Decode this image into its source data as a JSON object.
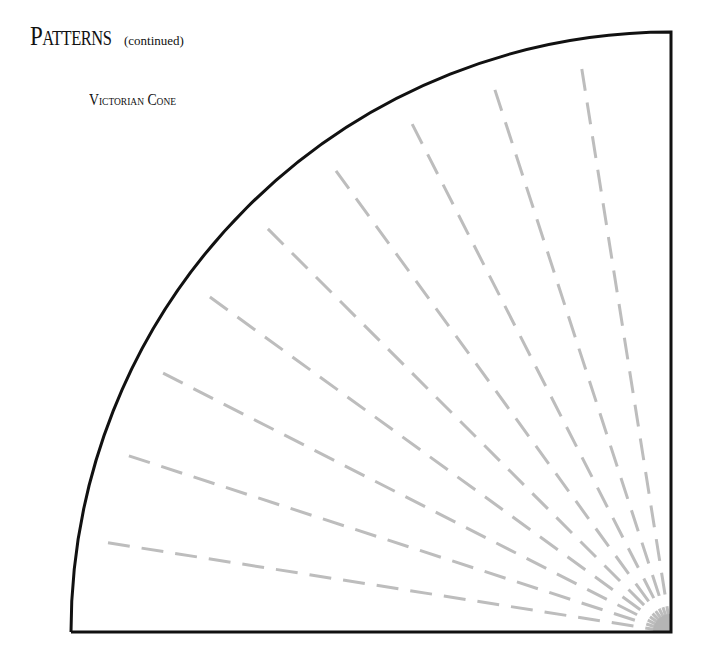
{
  "page": {
    "title": "Patterns",
    "title_suffix": "(continued)",
    "pattern_name": "Victorian Cone"
  },
  "pattern": {
    "shape": "quarter-circle",
    "apex": [
      671,
      632
    ],
    "radius": 600,
    "ray_count": 9,
    "ray_angles_deg": [
      9,
      18,
      27,
      36,
      45,
      54,
      63,
      72,
      81
    ],
    "outline_color": "#111111",
    "ray_color": "#bdbdbd",
    "apex_fill_color": "#b5b5b5"
  }
}
